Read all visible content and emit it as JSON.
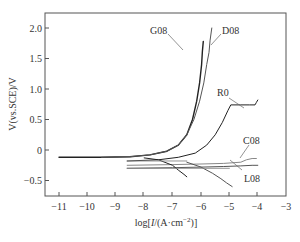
{
  "chart_data": {
    "type": "line",
    "title": "",
    "xlabel": "log[I/(A·cm⁻²)]",
    "ylabel": "V(vs.SCE)/V",
    "xlim": [
      -11.5,
      -3
    ],
    "ylim": [
      -0.75,
      2.25
    ],
    "xticks": [
      -11,
      -10,
      -9,
      -8,
      -7,
      -6,
      -5,
      -4,
      -3
    ],
    "yticks": [
      -0.5,
      0,
      0.5,
      1.0,
      1.5,
      2.0
    ],
    "xtick_labels": [
      "−11",
      "−10",
      "−9",
      "−8",
      "−7",
      "−6",
      "−5",
      "−4",
      "−3"
    ],
    "ytick_labels": [
      "−0.5",
      "0",
      "0.5",
      "1.0",
      "1.5",
      "2.0"
    ],
    "grid": false,
    "legend": "inline labels",
    "series": [
      {
        "name": "G08",
        "x": [
          -11,
          -9.5,
          -8.5,
          -7.8,
          -7.2,
          -6.8,
          -6.5,
          -6.3,
          -6.15,
          -6.05,
          -5.98,
          -5.95,
          -5.92
        ],
        "y": [
          -0.12,
          -0.12,
          -0.11,
          -0.08,
          -0.02,
          0.08,
          0.25,
          0.5,
          0.8,
          1.1,
          1.4,
          1.62,
          1.78
        ]
      },
      {
        "name": "D08",
        "x": [
          -9.5,
          -8.5,
          -7.8,
          -7.2,
          -6.8,
          -6.5,
          -6.25,
          -6.05,
          -5.9,
          -5.8,
          -5.72,
          -5.68,
          -5.62
        ],
        "y": [
          -0.12,
          -0.11,
          -0.08,
          -0.02,
          0.08,
          0.25,
          0.5,
          0.8,
          1.1,
          1.4,
          1.6,
          1.8,
          2.0
        ]
      },
      {
        "name": "R0",
        "x": [
          -8.6,
          -7.5,
          -6.8,
          -6.2,
          -5.8,
          -5.5,
          -5.25,
          -5.05,
          -4.95,
          -4.6,
          -4.3,
          -4.1,
          -4.05,
          -4.0
        ],
        "y": [
          -0.18,
          -0.16,
          -0.12,
          -0.05,
          0.08,
          0.25,
          0.45,
          0.65,
          0.74,
          0.74,
          0.74,
          0.74,
          0.78,
          0.82
        ]
      },
      {
        "name": "C08",
        "x": [
          -8.6,
          -7,
          -6,
          -5.2,
          -4.6,
          -4.4,
          -4.2,
          -4.05
        ],
        "y": [
          -0.25,
          -0.24,
          -0.23,
          -0.22,
          -0.2,
          -0.16,
          -0.14,
          -0.14
        ]
      },
      {
        "name": "L08",
        "x": [
          -8.6,
          -7,
          -6,
          -5.2,
          -4.6,
          -4.2,
          -4.0
        ],
        "y": [
          -0.3,
          -0.29,
          -0.28,
          -0.27,
          -0.26,
          -0.25,
          -0.25
        ]
      },
      {
        "name": "G08/D08 cathodic",
        "x": [
          -8.0,
          -7.5,
          -7.0,
          -6.8,
          -6.6,
          -6.5
        ],
        "y": [
          -0.13,
          -0.16,
          -0.25,
          -0.33,
          -0.4,
          -0.44
        ]
      },
      {
        "name": "R0/C08/L08 cathodic",
        "x": [
          -6.5,
          -6.0,
          -5.6,
          -5.3,
          -5.1,
          -4.9
        ],
        "y": [
          -0.2,
          -0.28,
          -0.38,
          -0.47,
          -0.54,
          -0.6
        ]
      }
    ],
    "annotations": [
      {
        "text": "G08",
        "x": -6.9,
        "y": 1.95
      },
      {
        "text": "D08",
        "x": -5.1,
        "y": 1.95
      },
      {
        "text": "R0",
        "x": -4.9,
        "y": 0.95
      },
      {
        "text": "C08",
        "x": -4.3,
        "y": 0.0
      },
      {
        "text": "L08",
        "x": -4.2,
        "y": -0.5
      }
    ]
  },
  "labels": {
    "ylabel": "V(vs.SCE)/V",
    "xlabel_prefix": "log[",
    "xlabel_italic": "I",
    "xlabel_suffix": "/(A·cm",
    "xlabel_sup": "−2",
    "xlabel_end": ")]",
    "g08": "G08",
    "d08": "D08",
    "r0": "R0",
    "c08": "C08",
    "l08": "L08"
  },
  "colors": {
    "axis": "#555555",
    "curve_dark": "#222222",
    "curve_mid": "#555555",
    "curve_light": "#888888"
  }
}
